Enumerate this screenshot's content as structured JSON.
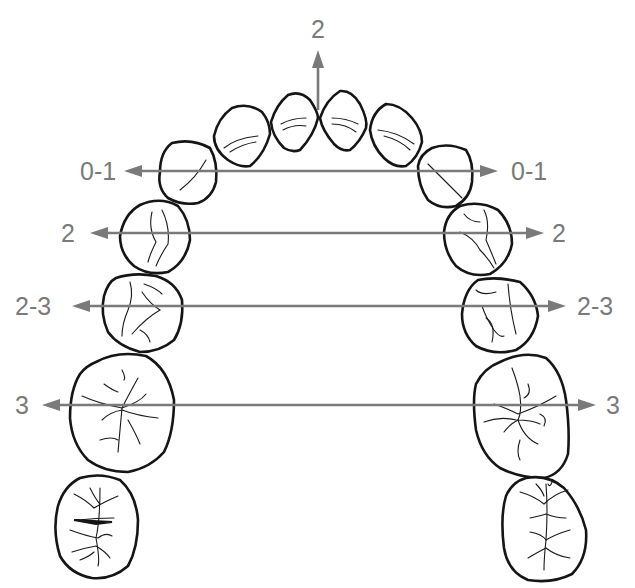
{
  "diagram": {
    "type": "dental-arch-occlusal-view",
    "arrow_color": "#7a7a7a",
    "outline_color": "#151515",
    "midline": {
      "label": "2",
      "direction": "up"
    },
    "levels": [
      {
        "name": "canines",
        "left_label": "0-1",
        "right_label": "0-1",
        "y": 171
      },
      {
        "name": "first-premolars",
        "left_label": "2",
        "right_label": "2",
        "y": 233
      },
      {
        "name": "second-premolars",
        "left_label": "2-3",
        "right_label": "2-3",
        "y": 306
      },
      {
        "name": "first-molars",
        "left_label": "3",
        "right_label": "3",
        "y": 405
      }
    ]
  }
}
